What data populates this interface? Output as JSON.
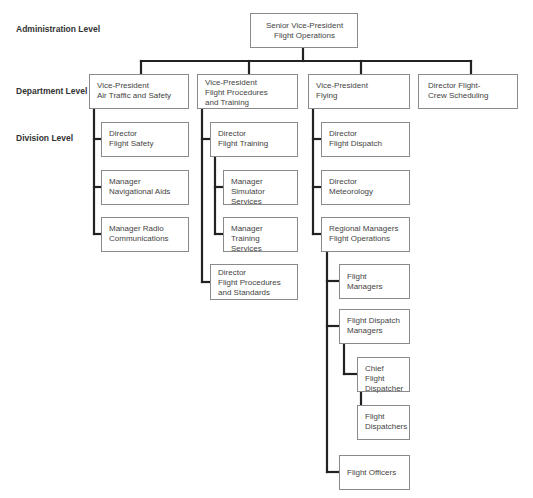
{
  "levels": {
    "administration": "Administration Level",
    "department": "Department Level",
    "division": "Division Level"
  },
  "org": {
    "senior_vp": "Senior Vice-President\nFlight Operations",
    "departments": [
      {
        "title": "Vice-President\nAir Traffic and Safety",
        "children": [
          "Director\nFlight Safety",
          "Manager\nNavigational Aids",
          "Manager Radio\nCommunications"
        ]
      },
      {
        "title": "Vice-President\nFlight Procedures\nand Training",
        "children": [
          {
            "title": "Director\nFlight Training",
            "children": [
              "Manager\nSimulator Services",
              "Manager\nTraining Services"
            ]
          },
          {
            "title": "Director\nFlight Procedures\nand Standards"
          }
        ]
      },
      {
        "title": "Vice-President\nFlying",
        "children": [
          {
            "title": "Director\nFlight Dispatch"
          },
          {
            "title": "Director\nMeteorology"
          },
          {
            "title": "Regional Managers\nFlight Operations",
            "children": [
              {
                "title": "Flight Managers"
              },
              {
                "title": "Flight Dispatch\nManagers",
                "children": [
                  {
                    "title": "Chief Flight\nDispatcher",
                    "children": [
                      {
                        "title": "Flight\nDispatchers"
                      }
                    ]
                  }
                ]
              },
              {
                "title": "Flight Officers"
              }
            ]
          }
        ]
      },
      {
        "title": "Director Flight-\nCrew Scheduling"
      }
    ]
  },
  "colors": {
    "box_border": "#8a8a8a",
    "connector": "#222222",
    "text": "#444444"
  }
}
